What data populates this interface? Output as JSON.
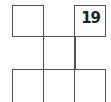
{
  "puzzle": {
    "cells": [
      {
        "row": 0,
        "col": 0,
        "value": ""
      },
      {
        "row": 0,
        "col": 2,
        "value": "19"
      },
      {
        "row": 2,
        "col": 0,
        "value": ""
      },
      {
        "row": 2,
        "col": 1,
        "value": ""
      },
      {
        "row": 2,
        "col": 2,
        "value": ""
      }
    ],
    "line_color": "#555555"
  }
}
